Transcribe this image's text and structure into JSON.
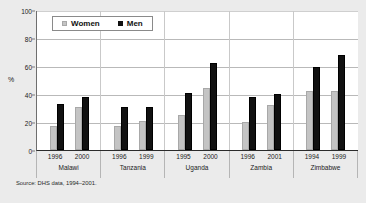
{
  "chart_data": {
    "type": "bar",
    "title": "",
    "xlabel": "",
    "ylabel": "%",
    "ylim": [
      0,
      100
    ],
    "yticks": [
      0,
      20,
      40,
      60,
      80,
      100
    ],
    "grid": true,
    "legend_position": "top-left-inside",
    "categories": [
      "Malawi",
      "Tanzania",
      "Uganda",
      "Zambia",
      "Zimbabwe"
    ],
    "legend": [
      "Women",
      "Men"
    ],
    "groups": [
      {
        "country": "Malawi",
        "years": [
          "1996",
          "2000"
        ],
        "series": [
          {
            "name": "Women",
            "values": [
              17,
              31
            ]
          },
          {
            "name": "Men",
            "values": [
              33,
              38
            ]
          }
        ]
      },
      {
        "country": "Tanzania",
        "years": [
          "1996",
          "1999"
        ],
        "series": [
          {
            "name": "Women",
            "values": [
              17,
              21
            ]
          },
          {
            "name": "Men",
            "values": [
              31,
              31
            ]
          }
        ]
      },
      {
        "country": "Uganda",
        "years": [
          "1995",
          "2000"
        ],
        "series": [
          {
            "name": "Women",
            "values": [
              25,
              44
            ]
          },
          {
            "name": "Men",
            "values": [
              41,
              62
            ]
          }
        ]
      },
      {
        "country": "Zambia",
        "years": [
          "1996",
          "2001"
        ],
        "series": [
          {
            "name": "Women",
            "values": [
              20,
              32
            ]
          },
          {
            "name": "Men",
            "values": [
              38,
              40
            ]
          }
        ]
      },
      {
        "country": "Zimbabwe",
        "years": [
          "1994",
          "1999"
        ],
        "series": [
          {
            "name": "Women",
            "values": [
              42,
              42
            ]
          },
          {
            "name": "Men",
            "values": [
              59,
              68
            ]
          }
        ]
      }
    ],
    "colors": {
      "women": "#c4c4c4",
      "men": "#111111",
      "plot_background": "#ffffff",
      "figure_background": "#ebebeb",
      "gridline": "#b9b9b9"
    }
  },
  "source": {
    "note": "Source: DHS data, 1994–2001."
  }
}
